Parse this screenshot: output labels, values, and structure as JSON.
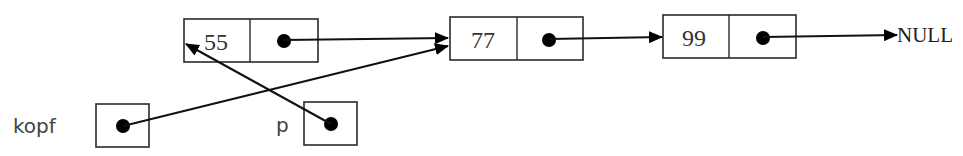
{
  "diagram": {
    "title": "",
    "type": "linked-list",
    "nodes": [
      {
        "id": "n55",
        "value": "55",
        "next": "n77"
      },
      {
        "id": "n77",
        "value": "77",
        "next": "n99"
      },
      {
        "id": "n99",
        "value": "99",
        "next": "NULL"
      }
    ],
    "pointers": [
      {
        "name": "kopf",
        "label": "kopf",
        "target": "n77"
      },
      {
        "name": "p",
        "label": "p",
        "target": "n55"
      }
    ],
    "null_label": "NULL",
    "colors": {
      "line": "#111111",
      "box_border": "#2a2a2a",
      "text": "#333333",
      "background": "#ffffff"
    }
  }
}
